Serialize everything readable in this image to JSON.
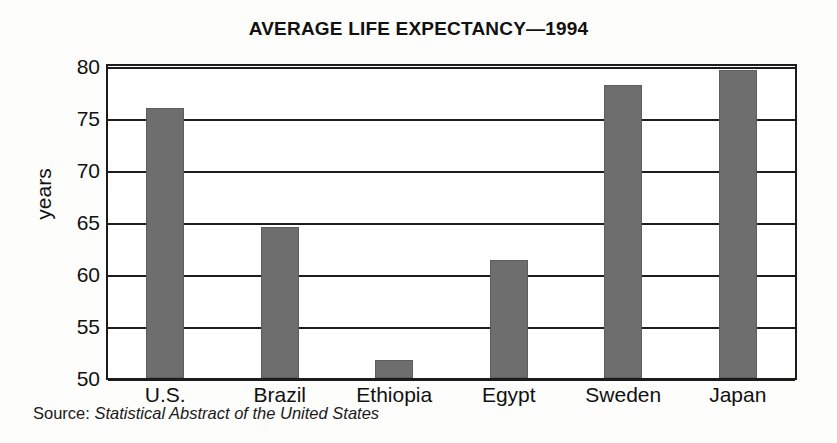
{
  "chart_data": {
    "type": "bar",
    "title": "AVERAGE LIFE EXPECTANCY—1994",
    "categories": [
      "U.S.",
      "Brazil",
      "Ethiopia",
      "Egypt",
      "Sweden",
      "Japan"
    ],
    "values": [
      76.0,
      64.5,
      51.7,
      61.3,
      78.2,
      79.6
    ],
    "xlabel": "",
    "ylabel": "years",
    "ylim": [
      50,
      80
    ],
    "yticks": [
      50,
      55,
      60,
      65,
      70,
      75,
      80
    ],
    "ytick_labels": [
      "50",
      "55",
      "60",
      "65",
      "70",
      "75",
      "80"
    ],
    "grid": true,
    "gridlines": "horizontal",
    "legend": "none",
    "bar_color": "#6e6e6e",
    "axis_color": "#1c1c1c",
    "background": "#ffffff"
  },
  "source": {
    "label": "Source:",
    "title": "Statistical Abstract of the United States"
  }
}
